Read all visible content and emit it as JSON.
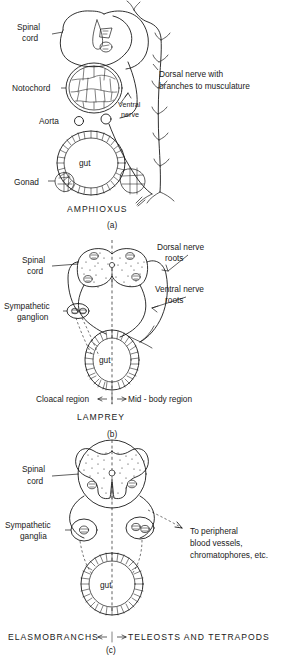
{
  "figure": {
    "title_implicit": "Comparative cross-sections of the chordate spinal cord and autonomic nervous system",
    "panels": [
      {
        "id": "a",
        "caption": "AMPHIOXUS",
        "panel_letter": "(a)",
        "labels": {
          "spinal_cord": "Spinal\ncord",
          "spinal_cord_line1": "Spinal",
          "spinal_cord_line2": "cord",
          "notochord": "Notochord",
          "aorta": "Aorta",
          "gut": "gut",
          "gonad": "Gonad",
          "ventral_nerve_line1": "Ventral",
          "ventral_nerve_line2": "nerve",
          "dorsal_nerve_line1": "Dorsal nerve with",
          "dorsal_nerve_line2": "branches to musculature"
        }
      },
      {
        "id": "b",
        "caption": "LAMPREY",
        "panel_letter": "(b)",
        "labels": {
          "spinal_cord_line1": "Spinal",
          "spinal_cord_line2": "cord",
          "sympathetic_line1": "Sympathetic",
          "sympathetic_line2": "ganglion",
          "gut": "gut",
          "dorsal_roots_line1": "Dorsal nerve",
          "dorsal_roots_line2": "roots",
          "ventral_roots_line1": "Ventral nerve",
          "ventral_roots_line2": "roots",
          "region_left": "Cloacal region",
          "region_right": "Mid - body region"
        }
      },
      {
        "id": "c",
        "caption_left": "ELASMOBRANCHS",
        "caption_right": "TELEOSTS AND TETRAPODS",
        "panel_letter": "(c)",
        "labels": {
          "spinal_cord_line1": "Spinal",
          "spinal_cord_line2": "cord",
          "sympathetic_line1": "Sympathetic",
          "sympathetic_line2": "ganglia",
          "gut": "gut",
          "peripheral_line1": "To peripheral",
          "peripheral_line2": "blood vessels,",
          "peripheral_line3": "chromatophores, etc."
        }
      }
    ],
    "colors": {
      "ink": "#1a1a1a",
      "background": "#ffffff",
      "stipple": "#2b2b2b"
    }
  }
}
